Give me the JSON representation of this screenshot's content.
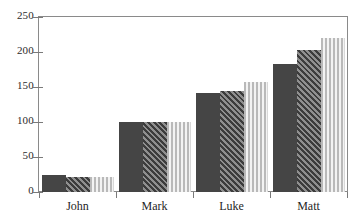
{
  "chart_data": {
    "type": "bar",
    "title": "",
    "subtitle": "",
    "xlabel": "",
    "ylabel": "",
    "categories": [
      "John",
      "Mark",
      "Luke",
      "Matt"
    ],
    "series": [
      {
        "name": "series-1-solid",
        "pattern": "solid",
        "color": "#454545",
        "values": [
          25,
          100,
          142,
          183
        ]
      },
      {
        "name": "series-2-hatch",
        "pattern": "diagonal-hatch",
        "color": "#4e4e4e",
        "values": [
          22,
          100,
          145,
          203
        ]
      },
      {
        "name": "series-3-stripe",
        "pattern": "vertical-stripes",
        "color": "#b9b9b9",
        "values": [
          22,
          100,
          157,
          220
        ]
      }
    ],
    "ylim": [
      0,
      250
    ],
    "ytick_labels": [
      "0",
      "50",
      "100",
      "150",
      "200",
      "250"
    ],
    "ytick_values": [
      0,
      50,
      100,
      150,
      200,
      250
    ],
    "grid": false,
    "legend": false,
    "legend_position": "none",
    "frame": true
  },
  "axes": {
    "y_ticks": [
      {
        "label": "250",
        "value": 250
      },
      {
        "label": "200",
        "value": 200
      },
      {
        "label": "150",
        "value": 150
      },
      {
        "label": "100",
        "value": 100
      },
      {
        "label": "50",
        "value": 50
      },
      {
        "label": "0",
        "value": 0
      }
    ],
    "x_categories": [
      {
        "label": "John"
      },
      {
        "label": "Mark"
      },
      {
        "label": "Luke"
      },
      {
        "label": "Matt"
      }
    ]
  },
  "colors": {
    "bar_solid": "#454545",
    "bar_hatch": "#4e4e4e",
    "bar_stripe": "#b9b9b9",
    "axis": "#7a7a7a",
    "frame": "#8a8a8a",
    "text": "#1f1f1f",
    "background": "#ffffff"
  }
}
